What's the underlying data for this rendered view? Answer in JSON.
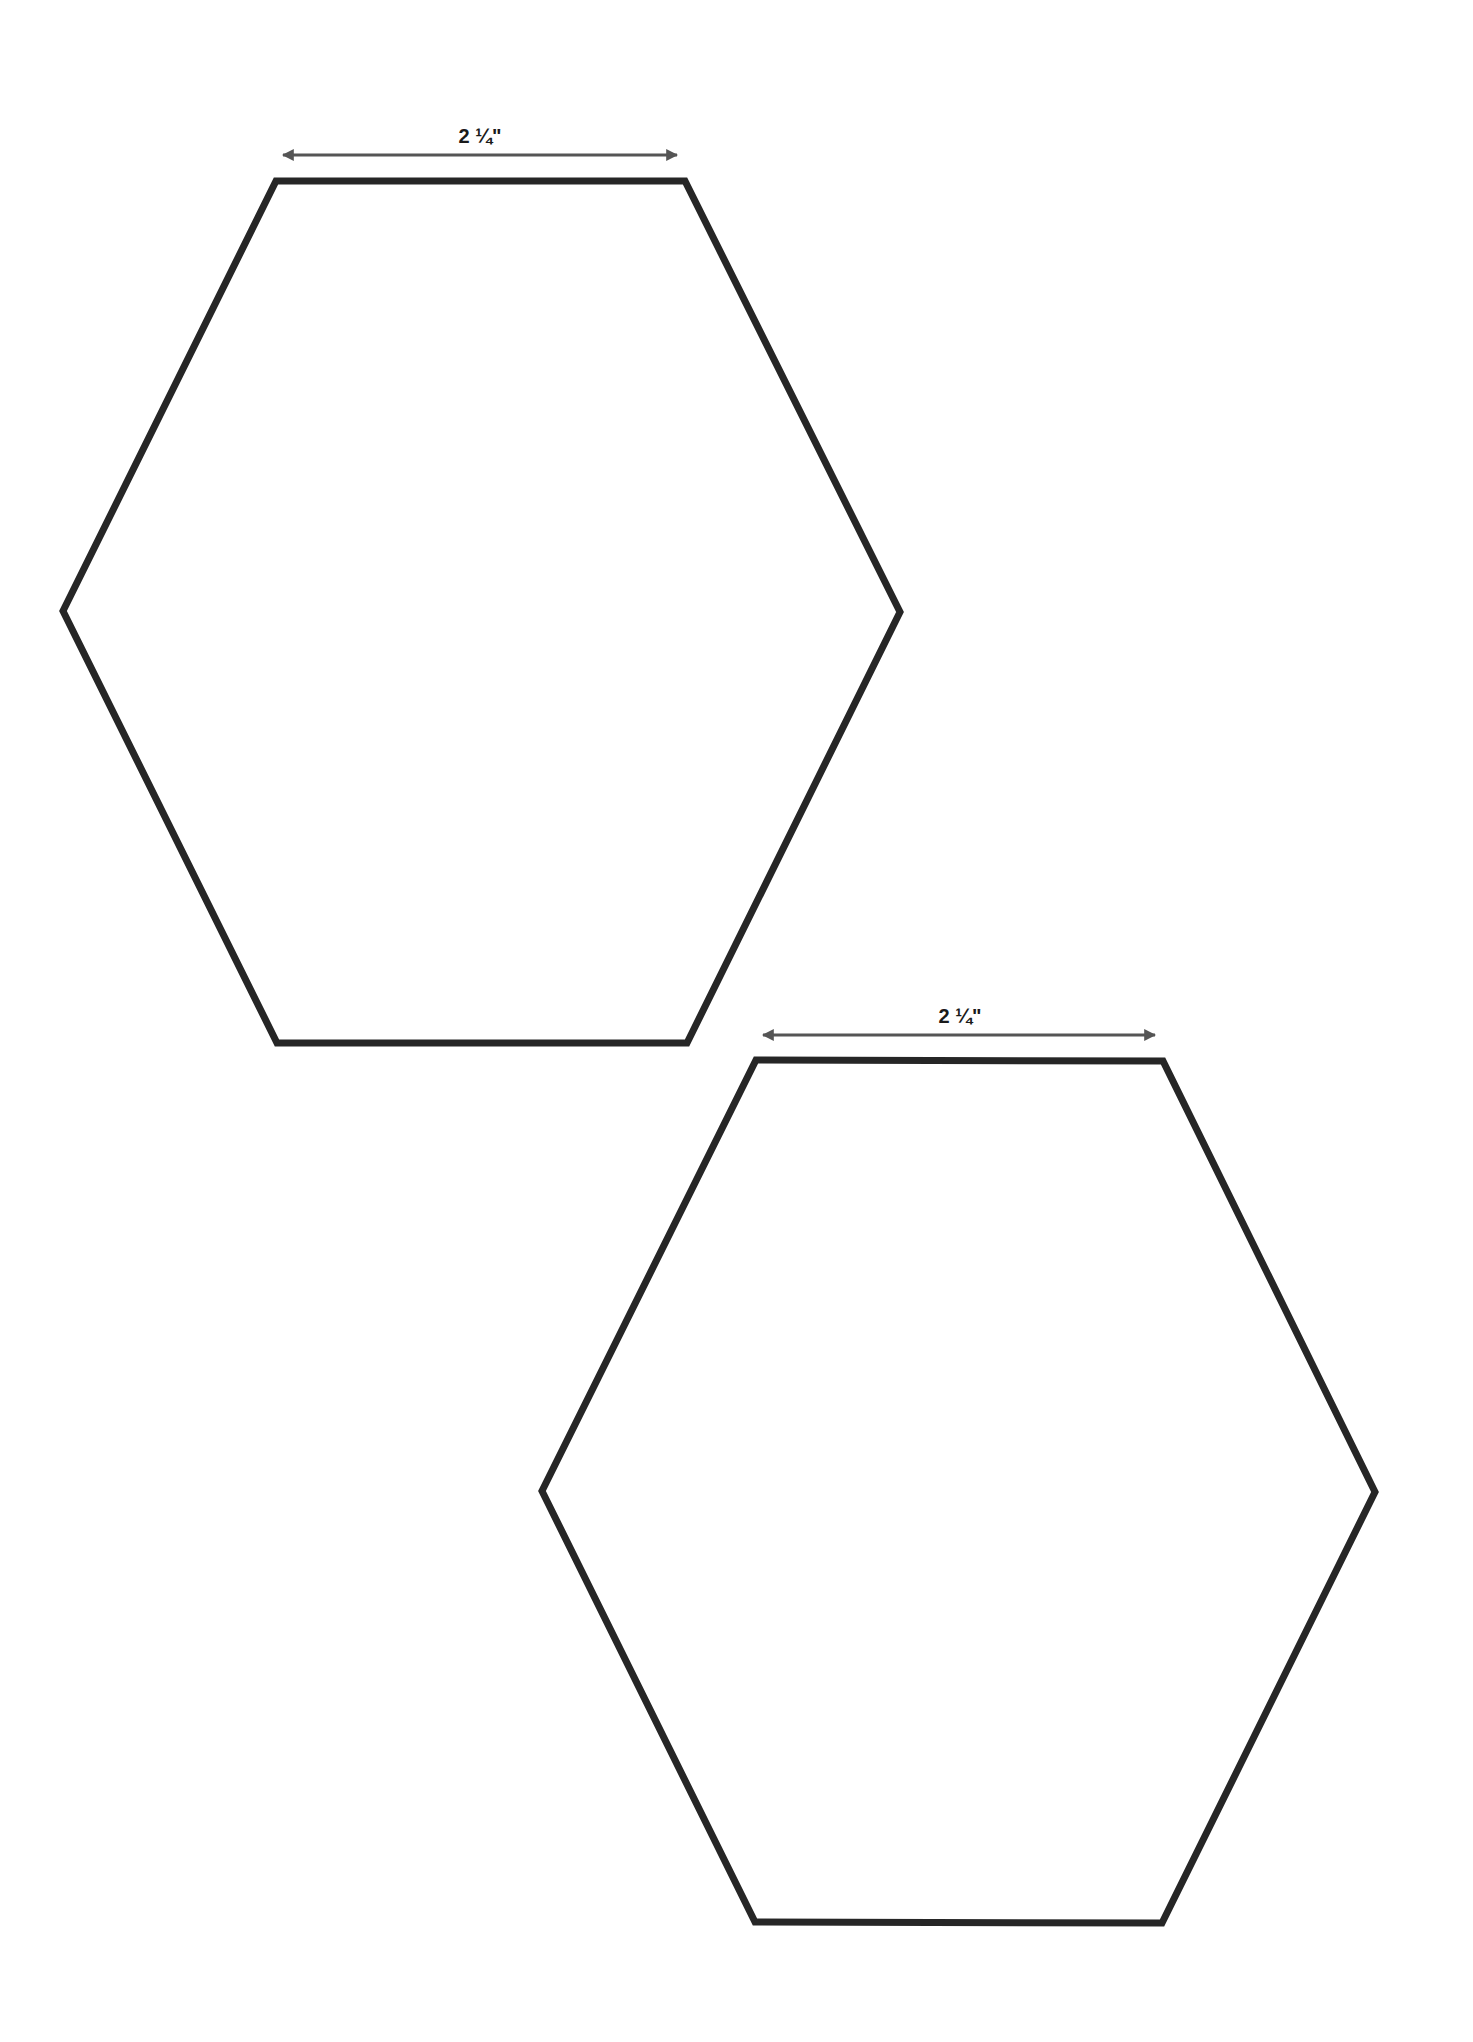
{
  "page": {
    "width": 1473,
    "height": 2042,
    "background": "#ffffff"
  },
  "style": {
    "outline_color": "#262626",
    "outline_width": 7,
    "arrow_color": "#555555",
    "label_color": "#1a1a1a",
    "label_size": 20
  },
  "templates": [
    {
      "name": "hexagon-template-1",
      "vertices": [
        [
          276,
          181
        ],
        [
          685,
          181
        ],
        [
          900,
          612
        ],
        [
          687,
          1043
        ],
        [
          277,
          1043
        ],
        [
          63,
          611
        ]
      ],
      "dimension": {
        "label": "2 ¼\"",
        "x1": 283,
        "x2": 677,
        "y": 155,
        "label_x": 480,
        "label_y": 143
      }
    },
    {
      "name": "hexagon-template-2",
      "vertices": [
        [
          756,
          1060
        ],
        [
          1163,
          1061
        ],
        [
          1375,
          1492
        ],
        [
          1162,
          1923
        ],
        [
          755,
          1922
        ],
        [
          542,
          1491
        ]
      ],
      "dimension": {
        "label": "2 ¼\"",
        "x1": 763,
        "x2": 1155,
        "y": 1035,
        "label_x": 960,
        "label_y": 1023
      }
    }
  ]
}
